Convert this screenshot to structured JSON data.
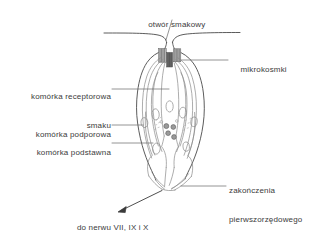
{
  "figure": {
    "kind": "anatomical-diagram",
    "language": "pl",
    "colors": {
      "background": "#ffffff",
      "outline": "#4a4a4a",
      "inner_line": "#8a8a8a",
      "faint_line": "#a8a8a8",
      "leader_line": "#707070",
      "text": "#3b3b3b",
      "microvilli_fill": "#9b9b9b",
      "microvilli_dark": "#5a5a5a",
      "vesicle_fill": "#8d8d8d"
    }
  },
  "labels": {
    "taste_pore": {
      "text": "otwór smakowy",
      "align": "center"
    },
    "microvilli": {
      "text": "mikrokosmki",
      "align": "left"
    },
    "receptor_cell": {
      "line1": "komórka receptorowa",
      "line2": "smaku",
      "align": "right"
    },
    "supporting_cell": {
      "text": "komórka podporowa",
      "align": "right"
    },
    "basal_cell": {
      "text": "komórka podstawna",
      "align": "right"
    },
    "afferent_endings": {
      "line1": "zakończenia",
      "line2": "pierwszorzędowego",
      "line3": "aferentu smaku",
      "align": "left"
    },
    "to_nerve": {
      "text": "do nerwu VII, IX i X",
      "align": "center"
    }
  }
}
